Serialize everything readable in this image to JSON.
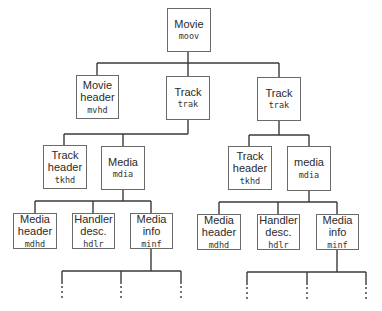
{
  "diagram": {
    "type": "tree",
    "title": "",
    "nodes": {
      "moov": {
        "label": "Movie",
        "code": "moov"
      },
      "mvhd": {
        "label1": "Movie",
        "label2": "header",
        "code": "mvhd"
      },
      "trak1": {
        "label": "Track",
        "code": "trak"
      },
      "trak2": {
        "label": "Track",
        "code": "trak"
      },
      "tkhd1": {
        "label1": "Track",
        "label2": "header",
        "code": "tkhd"
      },
      "mdia1": {
        "label": "Media",
        "code": "mdia"
      },
      "tkhd2": {
        "label1": "Track",
        "label2": "header",
        "code": "tkhd"
      },
      "mdia2": {
        "label": "media",
        "code": "mdia"
      },
      "mdhd1": {
        "label1": "Media",
        "label2": "header",
        "code": "mdhd"
      },
      "hdlr1": {
        "label1": "Handler",
        "label2": "desc.",
        "code": "hdlr"
      },
      "minf1": {
        "label1": "Media",
        "label2": "info",
        "code": "minf"
      },
      "mdhd2": {
        "label1": "Media",
        "label2": "header",
        "code": "mdhd"
      },
      "hdlr2": {
        "label1": "Handler",
        "label2": "desc.",
        "code": "hdlr"
      },
      "minf2": {
        "label1": "Media",
        "label2": "info",
        "code": "minf"
      }
    },
    "edges": [
      [
        "moov",
        "mvhd"
      ],
      [
        "moov",
        "trak1"
      ],
      [
        "moov",
        "trak2"
      ],
      [
        "trak1",
        "tkhd1"
      ],
      [
        "trak1",
        "mdia1"
      ],
      [
        "trak2",
        "tkhd2"
      ],
      [
        "trak2",
        "mdia2"
      ],
      [
        "mdia1",
        "mdhd1"
      ],
      [
        "mdia1",
        "hdlr1"
      ],
      [
        "mdia1",
        "minf1"
      ],
      [
        "mdia2",
        "mdhd2"
      ],
      [
        "mdia2",
        "hdlr2"
      ],
      [
        "mdia2",
        "minf2"
      ]
    ],
    "continuation": "minf nodes each have three children continuing below (shown as dotted stubs)"
  }
}
